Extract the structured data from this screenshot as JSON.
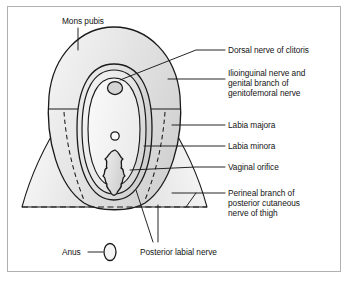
{
  "figure": {
    "frame_border_color": "#b0b0b0",
    "background_color": "#ffffff",
    "line_color": "#1a1a1a",
    "fill_light": "#f2f2f2",
    "fill_mid": "#e0e0e0",
    "fill_dark": "#cfcfcf"
  },
  "labels": {
    "mons_pubis": "Mons pubis",
    "dorsal_nerve_of_clitoris": "Dorsal nerve of clitoris",
    "ilioinguinal_line1": "Ilioinguinal nerve and",
    "ilioinguinal_line2": "genital branch of",
    "ilioinguinal_line3": "genitofemoral nerve",
    "labia_majora": "Labia majora",
    "labia_minora": "Labia minora",
    "vaginal_orifice": "Vaginal orifice",
    "perineal_line1": "Perineal branch of",
    "perineal_line2": "posterior cutaneous",
    "perineal_line3": "nerve of thigh",
    "anus": "Anus",
    "posterior_labial_nerve": "Posterior labial nerve"
  },
  "structures": {
    "mons_pubis": "mons-pubis-dome",
    "labia_majora": "labia-majora-outer-oval",
    "labia_minora": "labia-minora-inner-oval",
    "clitoris": "clitoris-small-oval",
    "urethral_orifice": "urethral-orifice-circle",
    "vaginal_orifice": "vaginal-orifice-lobed",
    "anus": "anus-oval",
    "thigh_left": "left-thigh-wedge",
    "thigh_right": "right-thigh-wedge",
    "perineal_boundary": "dashed-perineal-boundary"
  }
}
